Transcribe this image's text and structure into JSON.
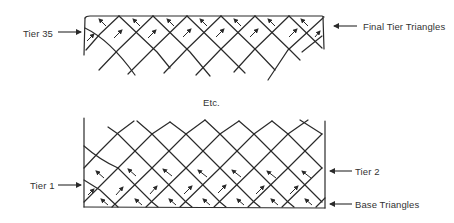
{
  "diagram": {
    "title": "",
    "top_panel": {
      "name": "final-tier-panel",
      "labels": {
        "left": "Tier 35",
        "right": "Final Tier Triangles"
      }
    },
    "separator": {
      "text": "Etc."
    },
    "bottom_panel": {
      "name": "base-tier-panel",
      "labels": {
        "left": "Tier 1",
        "right_upper": "Tier 2",
        "right_lower": "Base Triangles"
      }
    },
    "colors": {
      "ink": "#2a2a2a",
      "background": "#ffffff"
    }
  }
}
